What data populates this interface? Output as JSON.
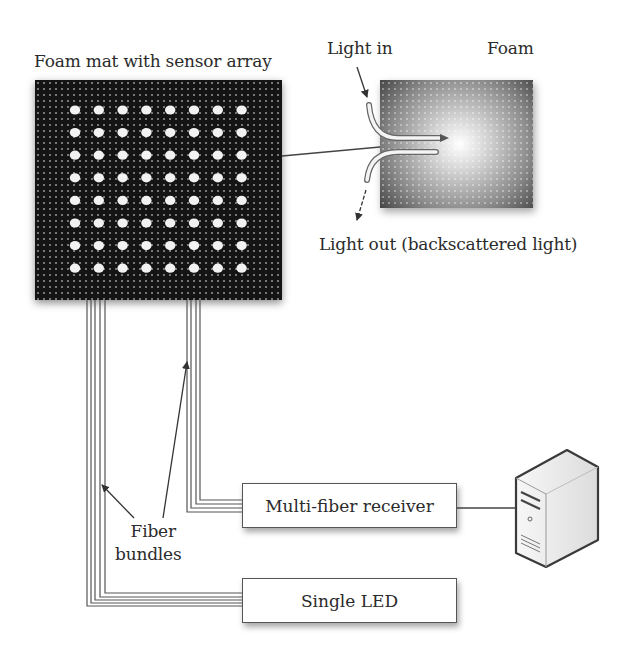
{
  "diagram": {
    "mat_label": "Foam mat with sensor array",
    "mat_grid": {
      "rows": 8,
      "cols": 8
    },
    "inset": {
      "light_in_label": "Light in",
      "foam_label": "Foam",
      "light_out_label": "Light out (backscattered light)"
    },
    "fiber_label_line1": "Fiber",
    "fiber_label_line2": "bundles",
    "receiver_label": "Multi-fiber receiver",
    "led_label": "Single LED",
    "computer_icon": "computer-tower-icon"
  },
  "colors": {
    "mat": "#141414",
    "dot": "#f2f2f2",
    "line": "#555555",
    "text": "#2b2b2b"
  }
}
